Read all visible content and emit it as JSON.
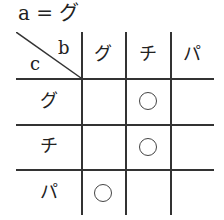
{
  "title": "a = グ",
  "table": {
    "corner": {
      "col_label": "b",
      "row_label": "c"
    },
    "columns": [
      "グ",
      "チ",
      "パ"
    ],
    "rows": [
      {
        "label": "グ",
        "cells": [
          "",
          "○",
          ""
        ]
      },
      {
        "label": "チ",
        "cells": [
          "",
          "○",
          ""
        ]
      },
      {
        "label": "パ",
        "cells": [
          "○",
          "",
          ""
        ]
      }
    ]
  }
}
